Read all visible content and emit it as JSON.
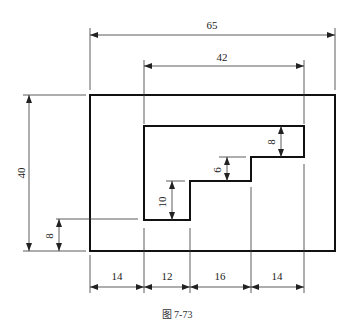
{
  "figure": {
    "caption": "图 7-73",
    "type": "technical drawing"
  },
  "dimensions": {
    "overall_width": "65",
    "inner_width": "42",
    "overall_height": "40",
    "bottom_offset": "8",
    "step_left": "10",
    "step_middle": "6",
    "step_right": "8",
    "bottom_segments": [
      "14",
      "12",
      "16",
      "14"
    ]
  },
  "colors": {
    "outline": "#111111",
    "dimension_line": "#333333",
    "background": "#ffffff"
  }
}
